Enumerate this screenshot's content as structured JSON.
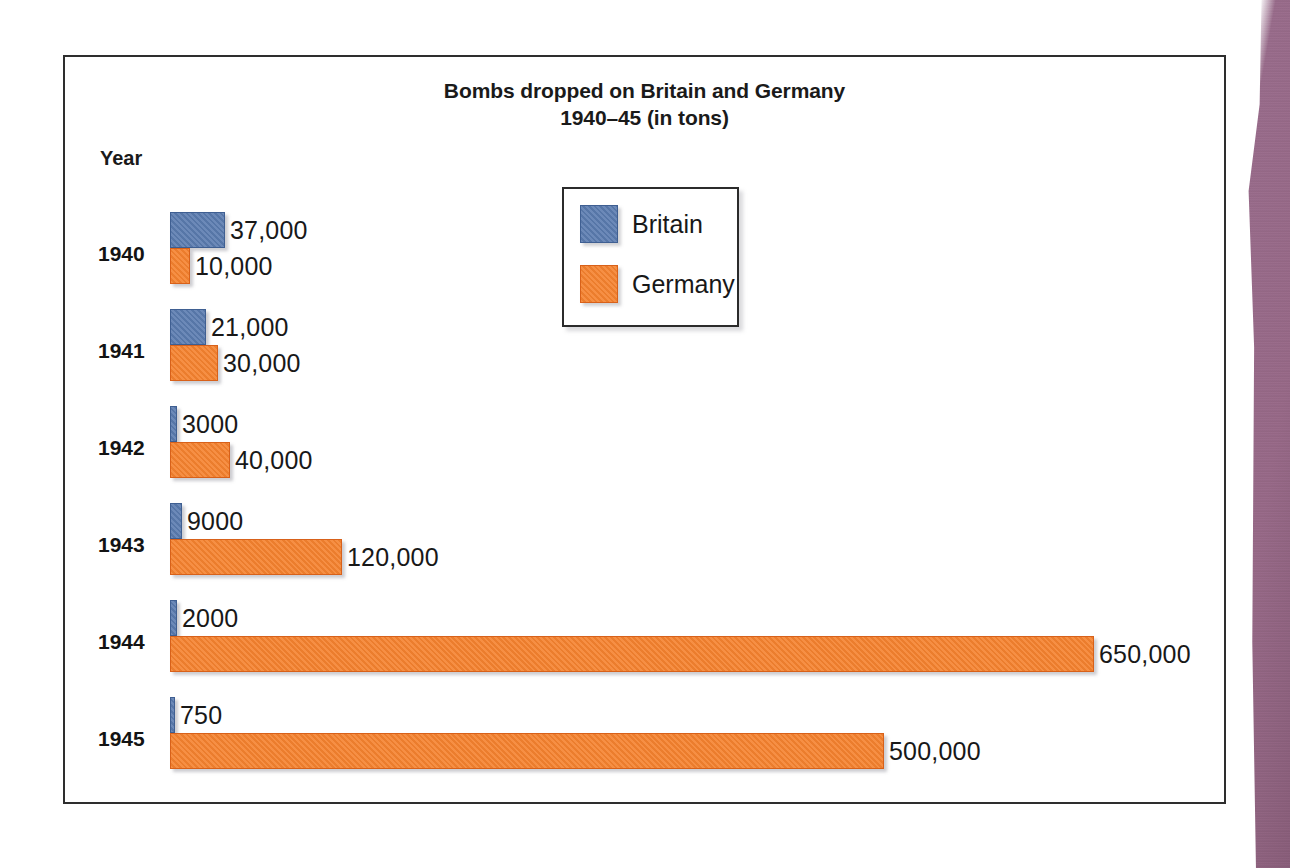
{
  "chart_data": {
    "type": "bar",
    "orientation": "horizontal",
    "title": "Bombs dropped on Britain and Germany 1940–45 (in tons)",
    "title_lines": [
      "Bombs dropped on Britain and Germany",
      "1940–45 (in tons)"
    ],
    "xlabel": "",
    "ylabel": "Year",
    "grid": false,
    "legend_position": "inside-upper-center",
    "categories": [
      "1940",
      "1941",
      "1942",
      "1943",
      "1944",
      "1945"
    ],
    "series": [
      {
        "name": "Britain",
        "color": "#5b7cb0",
        "values": [
          37000,
          21000,
          3000,
          9000,
          2000,
          750
        ],
        "labels": [
          "37,000",
          "21,000",
          "3000",
          "9000",
          "2000",
          "750"
        ],
        "bar_px": [
          55,
          36,
          7,
          12,
          7,
          5
        ]
      },
      {
        "name": "Germany",
        "color": "#f5822f",
        "values": [
          10000,
          30000,
          40000,
          120000,
          650000,
          500000
        ],
        "labels": [
          "10,000",
          "30,000",
          "40,000",
          "120,000",
          "650,000",
          "500,000"
        ],
        "bar_px": [
          20,
          48,
          60,
          172,
          924,
          714
        ]
      }
    ],
    "rows": [
      {
        "year": "1940",
        "britain_label": "37,000",
        "germany_label": "10,000",
        "britain_px": 55,
        "germany_px": 20
      },
      {
        "year": "1941",
        "britain_label": "21,000",
        "germany_label": "30,000",
        "britain_px": 36,
        "germany_px": 48
      },
      {
        "year": "1942",
        "britain_label": "3000",
        "germany_label": "40,000",
        "britain_px": 7,
        "germany_px": 60
      },
      {
        "year": "1943",
        "britain_label": "9000",
        "germany_label": "120,000",
        "britain_px": 12,
        "germany_px": 172
      },
      {
        "year": "1944",
        "britain_label": "2000",
        "germany_label": "650,000",
        "britain_px": 7,
        "germany_px": 924
      },
      {
        "year": "1945",
        "britain_label": "750",
        "germany_label": "500,000",
        "britain_px": 5,
        "germany_px": 714
      }
    ]
  },
  "axis": {
    "year_label": "Year"
  },
  "legend": {
    "entries": [
      {
        "label": "Britain",
        "color": "#5b7cb0",
        "key": "britain"
      },
      {
        "label": "Germany",
        "color": "#f5822f",
        "key": "germany"
      }
    ]
  },
  "colors": {
    "britain": "#5b7cb0",
    "germany": "#f5822f",
    "frame": "#2e2e2e",
    "text": "#181818",
    "page_edge": "#8d5c7c"
  }
}
